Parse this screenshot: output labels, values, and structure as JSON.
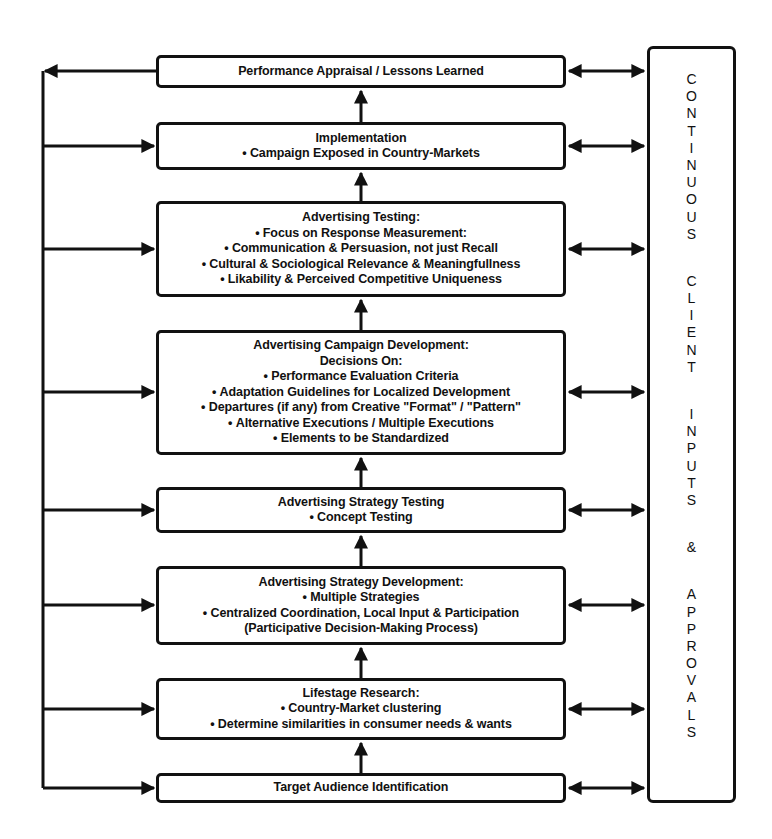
{
  "diagram": {
    "title": "",
    "stages": [
      {
        "id": "performance-appraisal",
        "title": "Performance Appraisal / Lessons Learned",
        "lines": []
      },
      {
        "id": "implementation",
        "title": "Implementation",
        "lines": [
          {
            "text": "Campaign Exposed in Country-Markets",
            "bullet": true
          }
        ]
      },
      {
        "id": "advertising-testing",
        "title": "Advertising Testing:",
        "lines": [
          {
            "text": "Focus on Response Measurement:",
            "bullet": true
          },
          {
            "text": "Communication & Persuasion, not just Recall",
            "bullet": true
          },
          {
            "text": "Cultural & Sociological Relevance & Meaningfullness",
            "bullet": true
          },
          {
            "text": "Likability & Perceived Competitive Uniqueness",
            "bullet": true
          }
        ]
      },
      {
        "id": "campaign-development",
        "title": "Advertising Campaign Development:",
        "lines": [
          {
            "text": "Decisions On:",
            "bullet": false
          },
          {
            "text": "Performance Evaluation Criteria",
            "bullet": true
          },
          {
            "text": "Adaptation Guidelines for Localized Development",
            "bullet": true
          },
          {
            "text": "Departures (if any) from Creative \"Format\" / \"Pattern\"",
            "bullet": true
          },
          {
            "text": "Alternative Executions / Multiple Executions",
            "bullet": true
          },
          {
            "text": "Elements to be Standardized",
            "bullet": true
          }
        ]
      },
      {
        "id": "strategy-testing",
        "title": "Advertising Strategy Testing",
        "lines": [
          {
            "text": "Concept Testing",
            "bullet": true
          }
        ]
      },
      {
        "id": "strategy-development",
        "title": "Advertising Strategy Development:",
        "lines": [
          {
            "text": "Multiple Strategies",
            "bullet": true
          },
          {
            "text": "Centralized Coordination, Local Input & Participation",
            "bullet": true
          },
          {
            "text": "(Participative Decision-Making Process)",
            "bullet": false
          }
        ]
      },
      {
        "id": "lifestage-research",
        "title": "Lifestage Research:",
        "lines": [
          {
            "text": "Country-Market clustering",
            "bullet": true
          },
          {
            "text": "Determine similarities in consumer needs & wants",
            "bullet": true
          }
        ]
      },
      {
        "id": "target-audience",
        "title": "Target Audience Identification",
        "lines": []
      }
    ],
    "side_panel": {
      "label": "CONTINUOUS CLIENT INPUTS & APPROVALS",
      "words": [
        "CONTINUOUS",
        "CLIENT",
        "INPUTS",
        "&",
        "APPROVALS"
      ]
    },
    "colors": {
      "line": "#111111",
      "background": "#ffffff"
    }
  }
}
